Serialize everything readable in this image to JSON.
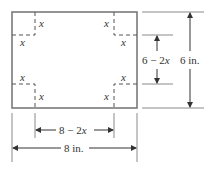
{
  "diagram": {
    "corner_labels": [
      "x",
      "x",
      "x",
      "x",
      "x",
      "x",
      "x",
      "x"
    ],
    "inner_height_label": {
      "num": "6 − 2",
      "var": "x"
    },
    "outer_height_label": "6 in.",
    "inner_width_label": {
      "num": "8 − 2",
      "var": "x"
    },
    "outer_width_label": "8 in.",
    "colors": {
      "outline": "#7a7a7a",
      "dash": "#555555",
      "text": "#333333",
      "ext": "#8a8a8a"
    }
  }
}
